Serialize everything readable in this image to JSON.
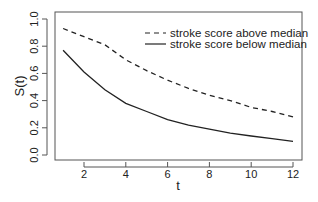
{
  "chart_data": {
    "type": "line",
    "title": "",
    "xlabel": "t",
    "ylabel": "S(t)",
    "xlim": [
      0.6,
      12.45
    ],
    "ylim": [
      -0.04,
      1.05
    ],
    "x_ticks": [
      2,
      4,
      6,
      8,
      10,
      12
    ],
    "y_ticks": [
      0.0,
      0.2,
      0.4,
      0.6,
      0.8,
      1.0
    ],
    "x_tick_labels": [
      "2",
      "4",
      "6",
      "8",
      "10",
      "12"
    ],
    "y_tick_labels": [
      "0.0",
      "0.2",
      "0.4",
      "0.6",
      "0.8",
      "1.0"
    ],
    "grid": false,
    "legend_position": "top-right",
    "x": [
      1,
      2,
      3,
      4,
      5,
      6,
      7,
      8,
      9,
      10,
      11,
      12
    ],
    "series": [
      {
        "name": "stroke score above median",
        "line_style": "dashed",
        "color": "#222222",
        "values": [
          0.93,
          0.87,
          0.81,
          0.7,
          0.62,
          0.55,
          0.49,
          0.44,
          0.4,
          0.35,
          0.32,
          0.28
        ]
      },
      {
        "name": "stroke score below median",
        "line_style": "solid",
        "color": "#222222",
        "values": [
          0.77,
          0.61,
          0.48,
          0.38,
          0.32,
          0.26,
          0.22,
          0.19,
          0.16,
          0.14,
          0.12,
          0.1
        ]
      }
    ]
  }
}
